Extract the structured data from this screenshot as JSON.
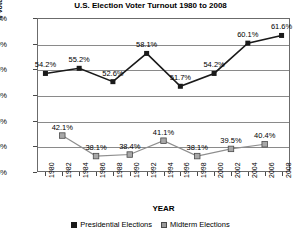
{
  "chart_data": {
    "type": "line",
    "title": "U.S. Election Voter Turnout 1980 to 2008",
    "xlabel": "YEAR",
    "ylabel": "% Voter Turnout",
    "ylim": [
      35,
      65
    ],
    "ytick_labels": [
      "65%",
      "60%",
      "55%",
      "50%",
      "45%",
      "40%",
      "35%"
    ],
    "ytick_values": [
      65,
      60,
      55,
      50,
      45,
      40,
      35
    ],
    "grid": true,
    "legend_position": "bottom",
    "x": [
      1980,
      1982,
      1984,
      1986,
      1988,
      1990,
      1992,
      1994,
      1996,
      1998,
      2000,
      2002,
      2004,
      2006,
      2008
    ],
    "xtick_labels": [
      "1980",
      "1982",
      "1984",
      "1986",
      "1988",
      "1990",
      "1992",
      "1994",
      "1996",
      "1998",
      "2000",
      "2002",
      "2004",
      "2006",
      "2008"
    ],
    "series": [
      {
        "name": "Presidential Elections",
        "color": "#1a1a1a",
        "marker": "square-filled",
        "x": [
          1980,
          1984,
          1988,
          1992,
          1996,
          2000,
          2004,
          2008
        ],
        "values": [
          54.2,
          55.2,
          52.6,
          58.1,
          51.7,
          54.2,
          60.1,
          61.6
        ],
        "labels": [
          "54.2%",
          "55.2%",
          "52.6%",
          "58.1%",
          "51.7%",
          "54.2%",
          "60.1%",
          "61.6%"
        ]
      },
      {
        "name": "Midterm Elections",
        "color": "#9a9a9a",
        "marker": "square-gray",
        "x": [
          1982,
          1986,
          1990,
          1994,
          1998,
          2002,
          2006
        ],
        "values": [
          42.1,
          38.1,
          38.4,
          41.1,
          38.1,
          39.5,
          40.4
        ],
        "labels": [
          "42.1%",
          "38.1%",
          "38.4%",
          "41.1%",
          "38.1%",
          "39.5%",
          "40.4%"
        ]
      }
    ]
  },
  "legend": {
    "presidential_label": "Presidential Elections",
    "midterm_label": "Midterm Elections"
  }
}
